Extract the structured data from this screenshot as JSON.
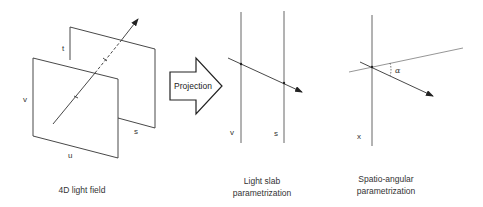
{
  "diagram": {
    "panels": {
      "light_field": {
        "caption": "4D light field",
        "labels": {
          "t": "t",
          "v": "v",
          "s": "s",
          "u": "u"
        }
      },
      "projection_arrow": {
        "label": "Projection"
      },
      "light_slab": {
        "caption_line1": "Light slab",
        "caption_line2": "parametrization",
        "labels": {
          "v": "v",
          "s": "s"
        }
      },
      "spatio_angular": {
        "caption_line1": "Spatio-angular",
        "caption_line2": "parametrization",
        "labels": {
          "x": "x",
          "alpha": "α"
        }
      }
    },
    "colors": {
      "line": "#333333",
      "guide_line": "#8a8a8a",
      "background": "#ffffff"
    }
  }
}
